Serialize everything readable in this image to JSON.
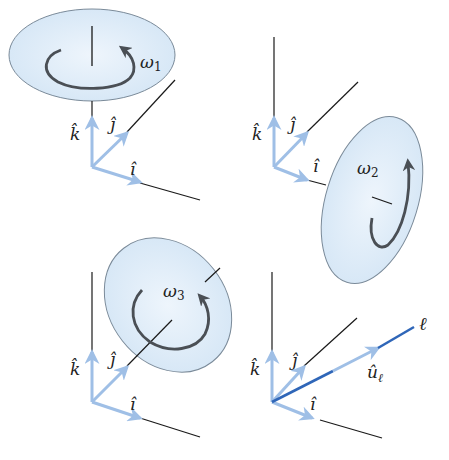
{
  "figure": {
    "colors": {
      "disk_fill": "#dcebf7",
      "disk_fill_inner": "#eaf3fb",
      "disk_stroke": "#7a8a99",
      "axis_line": "#1a1a1a",
      "unit_vector": "#9fbfe6",
      "rotation_arrow": "#4a4f55",
      "line_l": "#2f66b8",
      "label": "#222222"
    },
    "panels": [
      {
        "id": "panel-1",
        "rotation_label": "ω",
        "rotation_sub": "1",
        "axis": "k (vertical)",
        "unit_labels": {
          "k": "k̂",
          "j": "ĵ",
          "i": "î"
        }
      },
      {
        "id": "panel-2",
        "rotation_label": "ω",
        "rotation_sub": "2",
        "axis": "i",
        "unit_labels": {
          "k": "k̂",
          "j": "ĵ",
          "i": "î"
        }
      },
      {
        "id": "panel-3",
        "rotation_label": "ω",
        "rotation_sub": "3",
        "axis": "j",
        "unit_labels": {
          "k": "k̂",
          "j": "ĵ",
          "i": "î"
        }
      },
      {
        "id": "panel-4",
        "line_label": "ℓ",
        "unit_vector_label": "û",
        "unit_vector_sub": "ℓ",
        "unit_labels": {
          "k": "k̂",
          "j": "ĵ",
          "i": "î"
        }
      }
    ]
  }
}
